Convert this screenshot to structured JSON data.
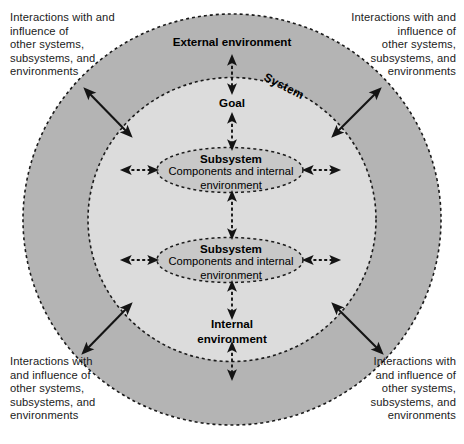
{
  "diagram": {
    "colors": {
      "outer_ring_fill": "#b4b4b4",
      "inner_circle_fill": "#dcdcdc",
      "ellipse_fill": "#c8c8c8",
      "boundary_stroke": "#1a1a1a",
      "background": "#ffffff",
      "text": "#1b1b1b"
    },
    "corners": {
      "top_left": "Interactions with and\ninfluence of\nother systems,\nsubsystems, and\nenvironments",
      "top_right": "Interactions with and\ninfluence of\nother systems,\nsubsystems, and\nenvironments",
      "bottom_left": "Interactions with\nand influence of\nother systems,\nsubsystems, and\nenvironments",
      "bottom_right": "Interactions with\nand influence of\nother systems,\nsubsystems, and\nenvironments"
    },
    "rings": {
      "outer_label": "External environment",
      "inner_label": "System"
    },
    "axis": {
      "goal": "Goal",
      "internal_environment": "Internal\nenvironment"
    },
    "subsystems": [
      {
        "title": "Subsystem",
        "detail": "Components and internal\nenvironment"
      },
      {
        "title": "Subsystem",
        "detail": "Components and internal\nenvironment"
      }
    ],
    "arrows": {
      "diagonal_outer": [
        {
          "name": "arrow-outer-top-left",
          "style": "solid",
          "heads": "double"
        },
        {
          "name": "arrow-outer-top-right",
          "style": "solid",
          "heads": "double"
        },
        {
          "name": "arrow-outer-bottom-left",
          "style": "solid",
          "heads": "double"
        },
        {
          "name": "arrow-outer-bottom-right",
          "style": "solid",
          "heads": "double"
        }
      ],
      "vertical_axis": [
        {
          "name": "arrow-external-to-goal",
          "style": "dashed",
          "heads": "double"
        },
        {
          "name": "arrow-goal-to-subsystem-1",
          "style": "dashed",
          "heads": "double"
        },
        {
          "name": "arrow-subsystem-1-to-subsystem-2",
          "style": "dashed",
          "heads": "double"
        },
        {
          "name": "arrow-subsystem-2-to-internal",
          "style": "dashed",
          "heads": "double"
        },
        {
          "name": "arrow-internal-to-external",
          "style": "dashed",
          "heads": "double"
        }
      ],
      "horizontal": [
        {
          "name": "arrow-subsystem-1-left",
          "style": "dashed",
          "heads": "double"
        },
        {
          "name": "arrow-subsystem-1-right",
          "style": "dashed",
          "heads": "double"
        },
        {
          "name": "arrow-subsystem-2-left",
          "style": "dashed",
          "heads": "double"
        },
        {
          "name": "arrow-subsystem-2-right",
          "style": "dashed",
          "heads": "double"
        }
      ]
    }
  }
}
